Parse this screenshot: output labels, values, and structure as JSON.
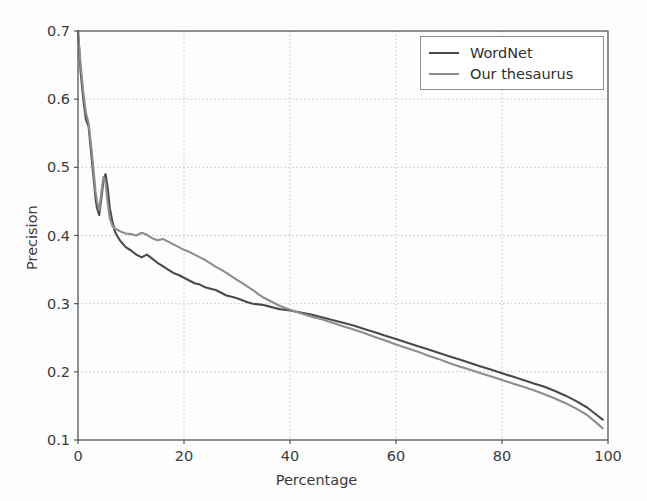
{
  "figure": {
    "background": "#fdfdfd",
    "axes_color": "#555555",
    "grid_color": "#bdbdbd"
  },
  "axis": {
    "xlabel": "Percentage",
    "ylabel": "Precision",
    "xticks": [
      "0",
      "20",
      "40",
      "60",
      "80",
      "100"
    ],
    "yticks": [
      "0.1",
      "0.2",
      "0.3",
      "0.4",
      "0.5",
      "0.6",
      "0.7"
    ]
  },
  "legend": {
    "items": [
      {
        "label": "WordNet",
        "color": "#4a4a4a"
      },
      {
        "label": "Our thesaurus",
        "color": "#8d8d8d"
      }
    ]
  },
  "chart_data": {
    "type": "line",
    "title": "",
    "xlabel": "Percentage",
    "ylabel": "Precision",
    "xlim": [
      0,
      100
    ],
    "ylim": [
      0.1,
      0.7
    ],
    "xticks": [
      0,
      20,
      40,
      60,
      80,
      100
    ],
    "yticks": [
      0.1,
      0.2,
      0.3,
      0.4,
      0.5,
      0.6,
      0.7
    ],
    "grid": true,
    "grid_style": "dotted",
    "legend_position": "upper right",
    "series": [
      {
        "name": "WordNet",
        "color": "#4a4a4a",
        "x": [
          0.0,
          0.5,
          1.0,
          1.5,
          2.0,
          2.5,
          3.0,
          3.3,
          3.6,
          4.0,
          4.4,
          4.8,
          5.2,
          5.6,
          6.0,
          6.5,
          7.0,
          7.5,
          8.0,
          9.0,
          10.0,
          11.0,
          12.0,
          13.0,
          14.0,
          15.0,
          16.0,
          17.0,
          18.0,
          19.0,
          20.0,
          21.0,
          22.0,
          23.0,
          24.0,
          25.0,
          26.0,
          27.0,
          28.0,
          29.0,
          30.0,
          31.0,
          32.0,
          33.0,
          34.0,
          35.0,
          36.0,
          37.0,
          38.0,
          39.0,
          40.0,
          42.0,
          44.0,
          46.0,
          48.0,
          50.0,
          52.0,
          54.0,
          56.0,
          58.0,
          60.0,
          62.0,
          64.0,
          66.0,
          68.0,
          70.0,
          72.0,
          74.0,
          76.0,
          78.0,
          80.0,
          82.0,
          84.0,
          86.0,
          88.0,
          90.0,
          92.0,
          94.0,
          96.0,
          98.0,
          99.0
        ],
        "y": [
          0.7,
          0.64,
          0.6,
          0.57,
          0.56,
          0.52,
          0.48,
          0.455,
          0.44,
          0.43,
          0.455,
          0.48,
          0.49,
          0.47,
          0.44,
          0.42,
          0.405,
          0.398,
          0.392,
          0.383,
          0.378,
          0.372,
          0.368,
          0.372,
          0.366,
          0.36,
          0.355,
          0.35,
          0.345,
          0.342,
          0.338,
          0.334,
          0.33,
          0.328,
          0.324,
          0.322,
          0.32,
          0.316,
          0.312,
          0.31,
          0.308,
          0.305,
          0.302,
          0.3,
          0.299,
          0.298,
          0.296,
          0.294,
          0.292,
          0.291,
          0.29,
          0.287,
          0.284,
          0.28,
          0.276,
          0.272,
          0.268,
          0.263,
          0.258,
          0.253,
          0.248,
          0.243,
          0.238,
          0.233,
          0.228,
          0.223,
          0.218,
          0.213,
          0.208,
          0.203,
          0.198,
          0.193,
          0.188,
          0.183,
          0.178,
          0.172,
          0.165,
          0.157,
          0.148,
          0.136,
          0.13
        ]
      },
      {
        "name": "Our thesaurus",
        "color": "#8d8d8d",
        "x": [
          0.0,
          0.5,
          1.0,
          1.5,
          2.0,
          2.5,
          3.0,
          3.3,
          3.6,
          4.0,
          4.4,
          4.8,
          5.2,
          5.6,
          6.0,
          6.5,
          7.0,
          7.5,
          8.0,
          9.0,
          10.0,
          11.0,
          12.0,
          13.0,
          14.0,
          15.0,
          16.0,
          17.0,
          18.0,
          19.0,
          20.0,
          21.0,
          22.0,
          23.0,
          24.0,
          25.0,
          26.0,
          27.0,
          28.0,
          29.0,
          30.0,
          31.0,
          32.0,
          33.0,
          34.0,
          35.0,
          36.0,
          37.0,
          38.0,
          39.0,
          40.0,
          42.0,
          44.0,
          46.0,
          48.0,
          50.0,
          52.0,
          54.0,
          56.0,
          58.0,
          60.0,
          62.0,
          64.0,
          66.0,
          68.0,
          70.0,
          72.0,
          74.0,
          76.0,
          78.0,
          80.0,
          82.0,
          84.0,
          86.0,
          88.0,
          90.0,
          92.0,
          94.0,
          96.0,
          98.0,
          99.0
        ],
        "y": [
          0.7,
          0.65,
          0.61,
          0.58,
          0.565,
          0.53,
          0.49,
          0.465,
          0.45,
          0.437,
          0.462,
          0.486,
          0.478,
          0.448,
          0.425,
          0.414,
          0.41,
          0.408,
          0.406,
          0.403,
          0.402,
          0.4,
          0.404,
          0.401,
          0.396,
          0.393,
          0.395,
          0.391,
          0.387,
          0.383,
          0.379,
          0.376,
          0.372,
          0.368,
          0.364,
          0.359,
          0.354,
          0.35,
          0.345,
          0.34,
          0.335,
          0.33,
          0.325,
          0.32,
          0.314,
          0.309,
          0.305,
          0.301,
          0.297,
          0.294,
          0.291,
          0.286,
          0.281,
          0.277,
          0.272,
          0.267,
          0.262,
          0.257,
          0.251,
          0.246,
          0.24,
          0.235,
          0.23,
          0.224,
          0.219,
          0.213,
          0.208,
          0.203,
          0.198,
          0.193,
          0.188,
          0.183,
          0.178,
          0.173,
          0.167,
          0.161,
          0.154,
          0.146,
          0.137,
          0.124,
          0.117
        ]
      }
    ]
  }
}
